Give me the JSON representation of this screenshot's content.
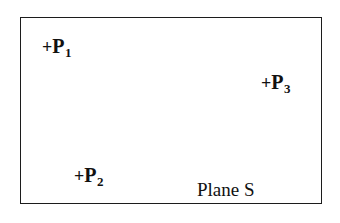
{
  "figure": {
    "caption_inside": "Plane S",
    "plane_name": "Plane S",
    "shape_name": "rectangle",
    "stroke_color": "#1c1c1c",
    "text_color": "#111111",
    "background_color": "#ffffff",
    "points": [
      {
        "id": "p1",
        "marker": "+",
        "letter": "P",
        "subscript": "1",
        "full_label": "+P1"
      },
      {
        "id": "p2",
        "marker": "+",
        "letter": "P",
        "subscript": "2",
        "full_label": "+P2"
      },
      {
        "id": "p3",
        "marker": "+",
        "letter": "P",
        "subscript": "3",
        "full_label": "+P3"
      }
    ]
  }
}
